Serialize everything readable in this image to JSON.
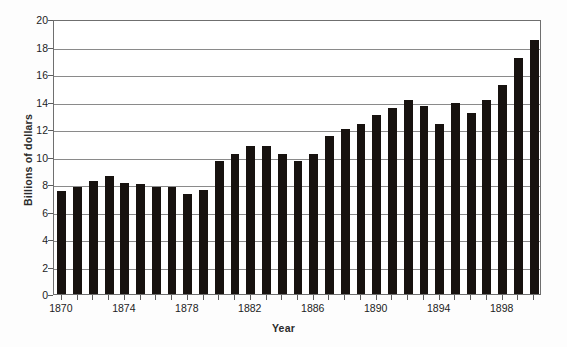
{
  "chart_data": {
    "type": "bar",
    "title": "",
    "xlabel": "Year",
    "ylabel": "Billions of dollars",
    "ylim": [
      0,
      20
    ],
    "ytick_step": 2,
    "yticks": [
      0,
      2,
      4,
      6,
      8,
      10,
      12,
      14,
      16,
      18,
      20
    ],
    "grid": true,
    "legend": null,
    "bar_color": "#17120f",
    "xtick_labels": [
      "1870",
      "1874",
      "1878",
      "1882",
      "1886",
      "1890",
      "1894",
      "1898"
    ],
    "xtick_years": [
      1870,
      1874,
      1878,
      1882,
      1886,
      1890,
      1894,
      1898
    ],
    "xlim": [
      1869.5,
      1900.5
    ],
    "categories": [
      "1870",
      "1871",
      "1872",
      "1873",
      "1874",
      "1875",
      "1876",
      "1877",
      "1878",
      "1879",
      "1880",
      "1881",
      "1882",
      "1883",
      "1884",
      "1885",
      "1886",
      "1887",
      "1888",
      "1889",
      "1890",
      "1891",
      "1892",
      "1893",
      "1894",
      "1895",
      "1896",
      "1897",
      "1898",
      "1899",
      "1900"
    ],
    "values": [
      7.5,
      7.8,
      8.2,
      8.6,
      8.1,
      8.0,
      7.8,
      7.8,
      7.3,
      7.6,
      9.7,
      10.2,
      10.8,
      10.8,
      10.2,
      9.7,
      10.2,
      11.5,
      12.0,
      12.4,
      13.0,
      13.5,
      14.1,
      13.7,
      12.4,
      13.9,
      13.2,
      14.1,
      15.2,
      17.2,
      18.5
    ]
  },
  "axes": {
    "y_title": "Billions of dollars",
    "x_title": "Year"
  }
}
